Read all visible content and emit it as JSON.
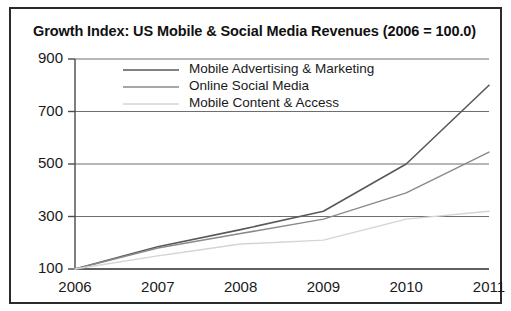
{
  "chart_data": {
    "type": "line",
    "title": "Growth Index: US Mobile & Social Media Revenues (2006 = 100.0)",
    "xlabel": "",
    "ylabel": "",
    "categories": [
      "2006",
      "2007",
      "2008",
      "2009",
      "2010",
      "2011"
    ],
    "x": [
      2006,
      2007,
      2008,
      2009,
      2010,
      2011
    ],
    "xlim": [
      2006,
      2011
    ],
    "ylim": [
      100,
      900
    ],
    "yticks": [
      100,
      300,
      500,
      700,
      900
    ],
    "ytick_labels": [
      "100",
      "300",
      "500",
      "700",
      "900"
    ],
    "xtick_labels": [
      "2006",
      "2007",
      "2008",
      "2009",
      "2010",
      "2011"
    ],
    "grid": "horizontal",
    "legend_position": "top-center",
    "series": [
      {
        "name": "Mobile Advertising & Marketing",
        "color": "#595959",
        "width": 1.6,
        "values": [
          100,
          185,
          250,
          320,
          500,
          800
        ]
      },
      {
        "name": "Online Social Media",
        "color": "#8a8a8a",
        "width": 1.5,
        "values": [
          100,
          180,
          235,
          290,
          390,
          545
        ]
      },
      {
        "name": "Mobile Content & Access",
        "color": "#d4d4d4",
        "width": 1.5,
        "values": [
          100,
          150,
          195,
          210,
          290,
          320
        ]
      }
    ]
  },
  "style": {
    "frame_border_color": "#2b2b2b",
    "axis_color": "#4a4a4a",
    "grid_color": "#6e6e6e",
    "background": "#ffffff",
    "text_color": "#1a1a1a"
  }
}
